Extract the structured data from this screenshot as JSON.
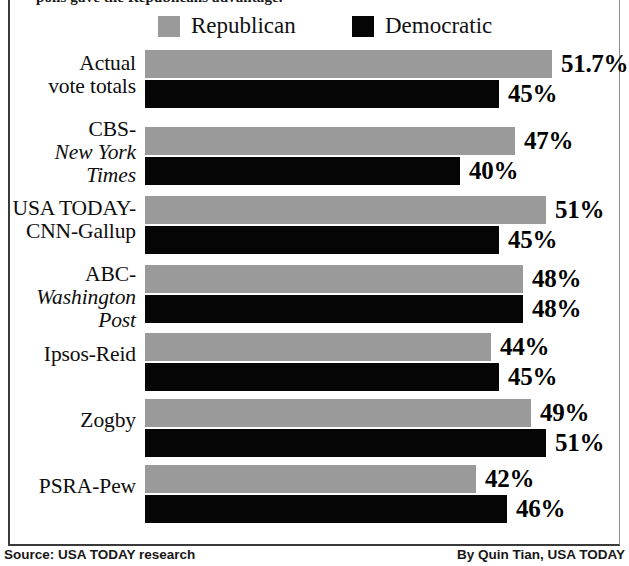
{
  "headline": {
    "clipped_text": "polls gave the Republicans advantage."
  },
  "legend": {
    "position": "top-center",
    "entries": [
      {
        "label": "Republican",
        "color": "#9a9a9a",
        "swatch": "gray-square-swatch"
      },
      {
        "label": "Democratic",
        "color": "#050505",
        "swatch": "black-square-swatch"
      }
    ]
  },
  "footer": {
    "source": "Source: USA TODAY research",
    "credit": "By Quin Tian, USA TODAY"
  },
  "chart_data": {
    "type": "bar",
    "orientation": "horizontal",
    "title": "",
    "subtitle": "",
    "xlabel": "",
    "ylabel": "",
    "xlim": [
      0,
      60
    ],
    "grid": false,
    "legend_position": "top-center",
    "categories": [
      "Actual vote totals",
      "CBS-New York Times",
      "USA TODAY-CNN-Gallup",
      "ABC-Washington Post",
      "Ipsos-Reid",
      "Zogby",
      "PSRA-Pew"
    ],
    "series": [
      {
        "name": "Republican",
        "color": "#9a9a9a",
        "values": [
          51.7,
          47,
          51,
          48,
          44,
          49,
          42
        ],
        "labels": [
          "51.7%",
          "47%",
          "51%",
          "48%",
          "44%",
          "49%",
          "42%"
        ]
      },
      {
        "name": "Democratic",
        "color": "#050505",
        "values": [
          45,
          40,
          45,
          48,
          45,
          51,
          46
        ],
        "labels": [
          "45%",
          "40%",
          "45%",
          "48%",
          "45%",
          "51%",
          "46%"
        ]
      }
    ]
  },
  "rows": [
    {
      "label_lines": [
        {
          "text": "Actual",
          "style": "normal"
        },
        {
          "text": "vote totals",
          "style": "normal"
        }
      ],
      "label_top": 52,
      "rep": {
        "value": 51.7,
        "label": "51.7%",
        "top": 50
      },
      "dem": {
        "value": 45,
        "label": "45%",
        "top": 80
      }
    },
    {
      "label_lines": [
        {
          "text": "CBS-",
          "style": "normal"
        },
        {
          "text": "New York",
          "style": "italic"
        },
        {
          "text": "Times",
          "style": "italic"
        }
      ],
      "label_top": 118,
      "rep": {
        "value": 47,
        "label": "47%",
        "top": 127
      },
      "dem": {
        "value": 40,
        "label": "40%",
        "top": 157
      }
    },
    {
      "label_lines": [
        {
          "text": "USA TODAY-",
          "style": "normal"
        },
        {
          "text": "CNN-Gallup",
          "style": "normal"
        }
      ],
      "label_top": 197,
      "rep": {
        "value": 51,
        "label": "51%",
        "top": 196
      },
      "dem": {
        "value": 45,
        "label": "45%",
        "top": 226
      }
    },
    {
      "label_lines": [
        {
          "text": "ABC-",
          "style": "normal"
        },
        {
          "text": "Washington",
          "style": "italic"
        },
        {
          "text": "Post",
          "style": "italic"
        }
      ],
      "label_top": 263,
      "rep": {
        "value": 48,
        "label": "48%",
        "top": 265
      },
      "dem": {
        "value": 48,
        "label": "48%",
        "top": 295
      }
    },
    {
      "label_lines": [
        {
          "text": "Ipsos-Reid",
          "style": "normal"
        }
      ],
      "label_top": 343,
      "rep": {
        "value": 44,
        "label": "44%",
        "top": 333
      },
      "dem": {
        "value": 45,
        "label": "45%",
        "top": 363
      }
    },
    {
      "label_lines": [
        {
          "text": "Zogby",
          "style": "normal"
        }
      ],
      "label_top": 409,
      "rep": {
        "value": 49,
        "label": "49%",
        "top": 399
      },
      "dem": {
        "value": 51,
        "label": "51%",
        "top": 429
      }
    },
    {
      "label_lines": [
        {
          "text": "PSRA-Pew",
          "style": "normal"
        }
      ],
      "label_top": 475,
      "rep": {
        "value": 42,
        "label": "42%",
        "top": 465
      },
      "dem": {
        "value": 46,
        "label": "46%",
        "top": 495
      }
    }
  ],
  "geometry": {
    "bar_origin_x": 145,
    "px_per_percent": 7.87,
    "bar_height": 28,
    "value_gap": 9
  }
}
